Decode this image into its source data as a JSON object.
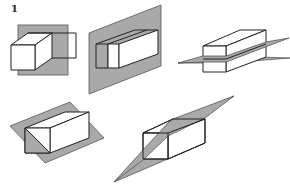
{
  "figure": {
    "label": "1",
    "colors": {
      "plane": "#a9a9a9",
      "outline": "#222222",
      "background": "#ffffff"
    },
    "panels": [
      {
        "id": "a",
        "plane": "vertical square, parallel to front face"
      },
      {
        "id": "b",
        "plane": "vertical parallelogram along box length"
      },
      {
        "id": "c",
        "plane": "horizontal plane cutting box"
      },
      {
        "id": "d",
        "plane": "tilted plane through box diagonal"
      },
      {
        "id": "e",
        "plane": "steep oblique plane through box"
      }
    ]
  }
}
